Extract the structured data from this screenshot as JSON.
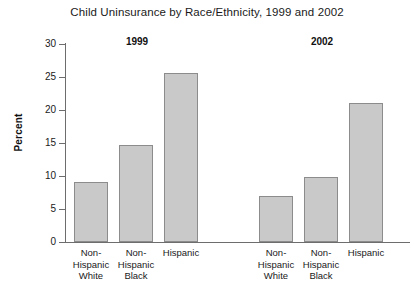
{
  "chart_data": {
    "type": "bar",
    "title": "Child Uninsurance by Race/Ethnicity, 1999 and 2002",
    "xlabel": "",
    "ylabel": "Percent",
    "ylim": [
      0,
      30
    ],
    "ytick_labels": [
      "30",
      "25",
      "20",
      "15",
      "10",
      "5",
      "0"
    ],
    "yticks": [
      30,
      25,
      20,
      15,
      10,
      5,
      0
    ],
    "grid": false,
    "legend": "none",
    "categories": [
      "Non-Hispanic White",
      "Non-Hispanic Black",
      "Hispanic"
    ],
    "groups": [
      {
        "label": "1999",
        "bars": [
          {
            "category": "Non-Hispanic White",
            "lines": [
              "Non-",
              "Hispanic",
              "White"
            ],
            "value": 9.1
          },
          {
            "category": "Non-Hispanic Black",
            "lines": [
              "Non-",
              "Hispanic",
              "Black"
            ],
            "value": 14.7
          },
          {
            "category": "Hispanic",
            "lines": [
              "Hispanic"
            ],
            "value": 25.6
          }
        ]
      },
      {
        "label": "2002",
        "bars": [
          {
            "category": "Non-Hispanic White",
            "lines": [
              "Non-",
              "Hispanic",
              "White"
            ],
            "value": 7.0
          },
          {
            "category": "Non-Hispanic Black",
            "lines": [
              "Non-",
              "Hispanic",
              "Black"
            ],
            "value": 9.8
          },
          {
            "category": "Hispanic",
            "lines": [
              "Hispanic"
            ],
            "value": 21.1
          }
        ]
      }
    ],
    "series": [
      {
        "name": "1999",
        "values": [
          9.1,
          14.7,
          25.6
        ]
      },
      {
        "name": "2002",
        "values": [
          7.0,
          9.8,
          21.1
        ]
      }
    ],
    "colors": {
      "bar_fill": "#c9c9c9",
      "bar_border": "#8c8c8c",
      "axis": "#6d6d6d",
      "text": "#1a1a1a",
      "background": "#ffffff"
    }
  }
}
